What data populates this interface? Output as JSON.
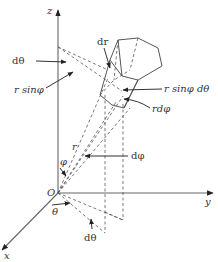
{
  "figure": {
    "axes": {
      "z": "z",
      "y": "y",
      "x": "x",
      "origin": "O"
    },
    "labels": {
      "d_theta_top": "dθ",
      "r_sin_phi": "r sinφ",
      "dr": "dr",
      "r_sin_phi_d_theta": "r sinφ dθ",
      "r_d_phi": "rdφ",
      "r": "r",
      "phi": "φ",
      "d_phi": "dφ",
      "theta": "θ",
      "d_theta_bottom": "dθ"
    },
    "colors": {
      "line": "#555555",
      "text": "#333333",
      "background": "#ffffff"
    }
  }
}
